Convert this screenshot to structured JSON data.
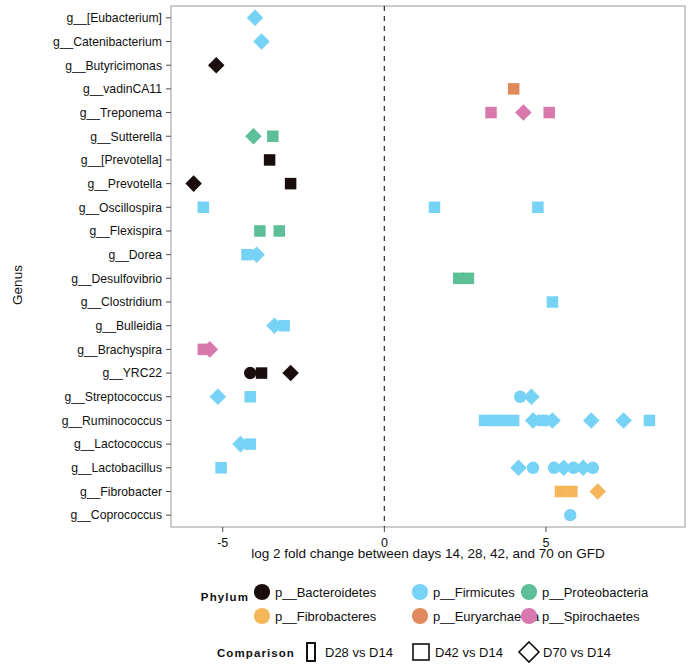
{
  "chart_data": {
    "type": "scatter",
    "title": "",
    "xlabel": "log 2 fold change between days 14, 28, 42, and 70 on GFD",
    "ylabel": "Genus",
    "xlim": [
      -6.6,
      9.3
    ],
    "xticks": [
      -5,
      0,
      5
    ],
    "xtick_labels": [
      "-5",
      "0",
      "5"
    ],
    "grid": false,
    "reference_line_x": 0,
    "categories": [
      "g__[Eubacterium]",
      "g__Catenibacterium",
      "g__Butyricimonas",
      "g__vadinCA11",
      "g__Treponema",
      "g__Sutterella",
      "g__[Prevotella]",
      "g__Prevotella",
      "g__Oscillospira",
      "g__Flexispira",
      "g__Dorea",
      "g__Desulfovibrio",
      "g__Clostridium",
      "g__Bulleidia",
      "g__Brachyspira",
      "g__YRC22",
      "g__Streptococcus",
      "g__Ruminococcus",
      "g__Lactococcus",
      "g__Lactobacillus",
      "g__Fibrobacter",
      "g__Coprococcus"
    ],
    "phylum_colors": {
      "p__Bacteroidetes": "#1a0d0d",
      "p__Fibrobacteres": "#f5b759",
      "p__Firmicutes": "#76d3f5",
      "p__Euryarchaeota": "#e08a5c",
      "p__Proteobacteria": "#5cbf97",
      "p__Spirochaetes": "#d978ad"
    },
    "comparison_shapes": {
      "D28 vs D14": "circle",
      "D42 vs D14": "square",
      "D70 vs D14": "diamond"
    },
    "points": [
      {
        "genus": "g__[Eubacterium]",
        "x": -4.0,
        "phylum": "p__Firmicutes",
        "comparison": "D70 vs D14"
      },
      {
        "genus": "g__Catenibacterium",
        "x": -3.8,
        "phylum": "p__Firmicutes",
        "comparison": "D70 vs D14"
      },
      {
        "genus": "g__Butyricimonas",
        "x": -5.2,
        "phylum": "p__Bacteroidetes",
        "comparison": "D70 vs D14"
      },
      {
        "genus": "g__vadinCA11",
        "x": 4.0,
        "phylum": "p__Euryarchaeota",
        "comparison": "D42 vs D14"
      },
      {
        "genus": "g__Treponema",
        "x": 3.3,
        "phylum": "p__Spirochaetes",
        "comparison": "D42 vs D14"
      },
      {
        "genus": "g__Treponema",
        "x": 4.3,
        "phylum": "p__Spirochaetes",
        "comparison": "D70 vs D14"
      },
      {
        "genus": "g__Treponema",
        "x": 5.1,
        "phylum": "p__Spirochaetes",
        "comparison": "D42 vs D14"
      },
      {
        "genus": "g__Sutterella",
        "x": -4.05,
        "phylum": "p__Proteobacteria",
        "comparison": "D70 vs D14"
      },
      {
        "genus": "g__Sutterella",
        "x": -3.45,
        "phylum": "p__Proteobacteria",
        "comparison": "D42 vs D14"
      },
      {
        "genus": "g__[Prevotella]",
        "x": -3.55,
        "phylum": "p__Bacteroidetes",
        "comparison": "D42 vs D14"
      },
      {
        "genus": "g__Prevotella",
        "x": -5.9,
        "phylum": "p__Bacteroidetes",
        "comparison": "D70 vs D14"
      },
      {
        "genus": "g__Prevotella",
        "x": -2.9,
        "phylum": "p__Bacteroidetes",
        "comparison": "D42 vs D14"
      },
      {
        "genus": "g__Oscillospira",
        "x": -5.6,
        "phylum": "p__Firmicutes",
        "comparison": "D42 vs D14"
      },
      {
        "genus": "g__Oscillospira",
        "x": 1.55,
        "phylum": "p__Firmicutes",
        "comparison": "D42 vs D14"
      },
      {
        "genus": "g__Oscillospira",
        "x": 4.75,
        "phylum": "p__Firmicutes",
        "comparison": "D42 vs D14"
      },
      {
        "genus": "g__Flexispira",
        "x": -3.85,
        "phylum": "p__Proteobacteria",
        "comparison": "D42 vs D14"
      },
      {
        "genus": "g__Flexispira",
        "x": -3.25,
        "phylum": "p__Proteobacteria",
        "comparison": "D42 vs D14"
      },
      {
        "genus": "g__Dorea",
        "x": -4.25,
        "phylum": "p__Firmicutes",
        "comparison": "D42 vs D14"
      },
      {
        "genus": "g__Dorea",
        "x": -3.95,
        "phylum": "p__Firmicutes",
        "comparison": "D70 vs D14"
      },
      {
        "genus": "g__Desulfovibrio",
        "x": 2.3,
        "phylum": "p__Proteobacteria",
        "comparison": "D42 vs D14"
      },
      {
        "genus": "g__Desulfovibrio",
        "x": 2.6,
        "phylum": "p__Proteobacteria",
        "comparison": "D42 vs D14"
      },
      {
        "genus": "g__Clostridium",
        "x": 5.2,
        "phylum": "p__Firmicutes",
        "comparison": "D42 vs D14"
      },
      {
        "genus": "g__Bulleidia",
        "x": -3.4,
        "phylum": "p__Firmicutes",
        "comparison": "D70 vs D14"
      },
      {
        "genus": "g__Bulleidia",
        "x": -3.1,
        "phylum": "p__Firmicutes",
        "comparison": "D42 vs D14"
      },
      {
        "genus": "g__Brachyspira",
        "x": -5.6,
        "phylum": "p__Spirochaetes",
        "comparison": "D42 vs D14"
      },
      {
        "genus": "g__Brachyspira",
        "x": -5.4,
        "phylum": "p__Spirochaetes",
        "comparison": "D70 vs D14"
      },
      {
        "genus": "g__YRC22",
        "x": -4.15,
        "phylum": "p__Bacteroidetes",
        "comparison": "D28 vs D14"
      },
      {
        "genus": "g__YRC22",
        "x": -3.8,
        "phylum": "p__Bacteroidetes",
        "comparison": "D42 vs D14"
      },
      {
        "genus": "g__YRC22",
        "x": -2.9,
        "phylum": "p__Bacteroidetes",
        "comparison": "D70 vs D14"
      },
      {
        "genus": "g__Streptococcus",
        "x": -5.15,
        "phylum": "p__Firmicutes",
        "comparison": "D70 vs D14"
      },
      {
        "genus": "g__Streptococcus",
        "x": -4.15,
        "phylum": "p__Firmicutes",
        "comparison": "D42 vs D14"
      },
      {
        "genus": "g__Streptococcus",
        "x": 4.2,
        "phylum": "p__Firmicutes",
        "comparison": "D28 vs D14"
      },
      {
        "genus": "g__Streptococcus",
        "x": 4.55,
        "phylum": "p__Firmicutes",
        "comparison": "D70 vs D14"
      },
      {
        "genus": "g__Ruminococcus",
        "x": 3.1,
        "phylum": "p__Firmicutes",
        "comparison": "D42 vs D14"
      },
      {
        "genus": "g__Ruminococcus",
        "x": 3.4,
        "phylum": "p__Firmicutes",
        "comparison": "D42 vs D14"
      },
      {
        "genus": "g__Ruminococcus",
        "x": 3.7,
        "phylum": "p__Firmicutes",
        "comparison": "D42 vs D14"
      },
      {
        "genus": "g__Ruminococcus",
        "x": 4.0,
        "phylum": "p__Firmicutes",
        "comparison": "D42 vs D14"
      },
      {
        "genus": "g__Ruminococcus",
        "x": 4.6,
        "phylum": "p__Firmicutes",
        "comparison": "D70 vs D14"
      },
      {
        "genus": "g__Ruminococcus",
        "x": 4.9,
        "phylum": "p__Firmicutes",
        "comparison": "D42 vs D14"
      },
      {
        "genus": "g__Ruminococcus",
        "x": 5.2,
        "phylum": "p__Firmicutes",
        "comparison": "D70 vs D14"
      },
      {
        "genus": "g__Ruminococcus",
        "x": 6.4,
        "phylum": "p__Firmicutes",
        "comparison": "D70 vs D14"
      },
      {
        "genus": "g__Ruminococcus",
        "x": 7.4,
        "phylum": "p__Firmicutes",
        "comparison": "D70 vs D14"
      },
      {
        "genus": "g__Ruminococcus",
        "x": 8.2,
        "phylum": "p__Firmicutes",
        "comparison": "D42 vs D14"
      },
      {
        "genus": "g__Lactococcus",
        "x": -4.45,
        "phylum": "p__Firmicutes",
        "comparison": "D70 vs D14"
      },
      {
        "genus": "g__Lactococcus",
        "x": -4.15,
        "phylum": "p__Firmicutes",
        "comparison": "D42 vs D14"
      },
      {
        "genus": "g__Lactobacillus",
        "x": -5.05,
        "phylum": "p__Firmicutes",
        "comparison": "D42 vs D14"
      },
      {
        "genus": "g__Lactobacillus",
        "x": 4.15,
        "phylum": "p__Firmicutes",
        "comparison": "D70 vs D14"
      },
      {
        "genus": "g__Lactobacillus",
        "x": 4.6,
        "phylum": "p__Firmicutes",
        "comparison": "D28 vs D14"
      },
      {
        "genus": "g__Lactobacillus",
        "x": 5.25,
        "phylum": "p__Firmicutes",
        "comparison": "D28 vs D14"
      },
      {
        "genus": "g__Lactobacillus",
        "x": 5.55,
        "phylum": "p__Firmicutes",
        "comparison": "D70 vs D14"
      },
      {
        "genus": "g__Lactobacillus",
        "x": 5.85,
        "phylum": "p__Firmicutes",
        "comparison": "D28 vs D14"
      },
      {
        "genus": "g__Lactobacillus",
        "x": 6.15,
        "phylum": "p__Firmicutes",
        "comparison": "D70 vs D14"
      },
      {
        "genus": "g__Lactobacillus",
        "x": 6.45,
        "phylum": "p__Firmicutes",
        "comparison": "D28 vs D14"
      },
      {
        "genus": "g__Fibrobacter",
        "x": 5.45,
        "phylum": "p__Fibrobacteres",
        "comparison": "D42 vs D14"
      },
      {
        "genus": "g__Fibrobacter",
        "x": 5.8,
        "phylum": "p__Fibrobacteres",
        "comparison": "D42 vs D14"
      },
      {
        "genus": "g__Fibrobacter",
        "x": 6.6,
        "phylum": "p__Fibrobacteres",
        "comparison": "D70 vs D14"
      },
      {
        "genus": "g__Coprococcus",
        "x": 5.75,
        "phylum": "p__Firmicutes",
        "comparison": "D28 vs D14"
      }
    ]
  },
  "legend": {
    "phylum_title": "Phylum",
    "comparison_title": "Comparison",
    "phylum_entries": [
      {
        "label": "p__Bacteroidetes",
        "color": "#1a0d0d"
      },
      {
        "label": "p__Fibrobacteres",
        "color": "#f5b759"
      },
      {
        "label": "p__Firmicutes",
        "color": "#76d3f5"
      },
      {
        "label": "p__Euryarchaeota",
        "color": "#e08a5c"
      },
      {
        "label": "p__Proteobacteria",
        "color": "#5cbf97"
      },
      {
        "label": "p__Spirochaetes",
        "color": "#d978ad"
      }
    ],
    "comparison_entries": [
      {
        "label": "D28 vs D14",
        "shape": "circle"
      },
      {
        "label": "D42 vs D14",
        "shape": "square"
      },
      {
        "label": "D70 vs D14",
        "shape": "diamond"
      }
    ]
  }
}
